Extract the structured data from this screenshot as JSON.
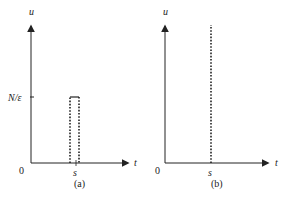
{
  "figure": {
    "colors": {
      "ink": "#222222",
      "background": "#ffffff"
    },
    "panels": [
      {
        "id": "a",
        "caption": "(a)",
        "y_axis_label": "u",
        "x_axis_label": "t",
        "origin_label": "0",
        "tick_x_label": "s",
        "tick_y_label": "N/ε",
        "shape": "dotted rectangular pulse of height N/ε starting at s"
      },
      {
        "id": "b",
        "caption": "(b)",
        "y_axis_label": "u",
        "x_axis_label": "t",
        "origin_label": "0",
        "tick_x_label": "s",
        "shape": "dotted vertical line (impulse) at s"
      }
    ]
  }
}
